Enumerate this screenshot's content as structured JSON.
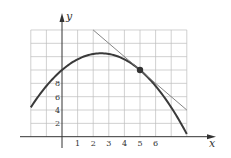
{
  "chart_data": {
    "type": "line",
    "title": "",
    "xlabel": "x",
    "ylabel": "y",
    "x_ticks": [
      "1",
      "2",
      "3",
      "4",
      "5",
      "6"
    ],
    "y_ticks": [
      "2",
      "4",
      "6",
      "8"
    ],
    "xlim": [
      -2,
      8
    ],
    "ylim": [
      0,
      16
    ],
    "grid": true,
    "series": [
      {
        "name": "curve",
        "kind": "parabola",
        "equation": "y = 10 + 2x - 0.4x^2",
        "x": [
          -2,
          -1,
          0,
          1,
          2,
          2.5,
          3,
          4,
          5,
          6,
          7,
          8
        ],
        "y": [
          4.4,
          7.6,
          10,
          11.6,
          12.4,
          12.5,
          12.4,
          11.6,
          10,
          7.6,
          4.4,
          0.4
        ]
      },
      {
        "name": "tangent line",
        "kind": "line",
        "x": [
          2,
          8
        ],
        "y": [
          16,
          4
        ]
      }
    ],
    "points": [
      {
        "label": "point of tangency",
        "x": 5,
        "y": 10
      }
    ]
  }
}
